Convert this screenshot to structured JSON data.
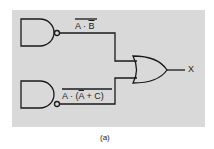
{
  "diagram": {
    "type": "logic-circuit",
    "gates": [
      {
        "id": "nand1",
        "kind": "NAND",
        "output_label": "A · B (overlined)"
      },
      {
        "id": "nand2",
        "kind": "NAND",
        "output_label": "A · (A + C) (overlined, inner A overlined)"
      },
      {
        "id": "or1",
        "kind": "OR",
        "output": "X"
      }
    ],
    "labels": {
      "top_a": "A · ",
      "top_b": "B",
      "bottom_a": "A · (",
      "bottom_abar": "A",
      "bottom_rest": " + C)",
      "output": "X"
    },
    "caption": "(a)",
    "colors": {
      "panel": "#d9d9d9",
      "line": "#1a1a1a"
    }
  }
}
